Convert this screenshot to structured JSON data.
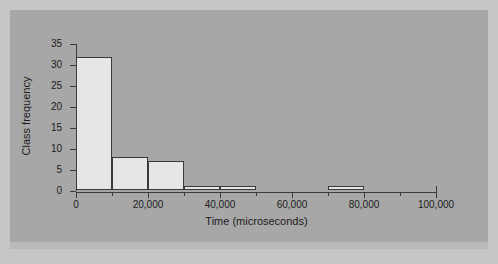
{
  "chart_data": {
    "type": "bar",
    "title": "",
    "subtitle": "",
    "xlabel": "Time (microseconds)",
    "ylabel": "Class frequency",
    "xlim": [
      0,
      100000
    ],
    "ylim": [
      0,
      35
    ],
    "grid": false,
    "legend": null,
    "bin_width": 10000,
    "x_ticks_major": [
      {
        "value": 0,
        "label": "0"
      },
      {
        "value": 20000,
        "label": "20,000"
      },
      {
        "value": 40000,
        "label": "40,000"
      },
      {
        "value": 60000,
        "label": "60,000"
      },
      {
        "value": 80000,
        "label": "80,000"
      },
      {
        "value": 100000,
        "label": "100,000"
      }
    ],
    "x_ticks_minor": [
      10000,
      30000,
      50000,
      70000,
      90000
    ],
    "y_ticks": [
      {
        "value": 0,
        "label": "0"
      },
      {
        "value": 5,
        "label": "5"
      },
      {
        "value": 10,
        "label": "10"
      },
      {
        "value": 15,
        "label": "15"
      },
      {
        "value": 20,
        "label": "20"
      },
      {
        "value": 25,
        "label": "25"
      },
      {
        "value": 30,
        "label": "30"
      },
      {
        "value": 35,
        "label": "35"
      }
    ],
    "bins": [
      {
        "start": 0,
        "end": 10000,
        "label": "0–10,000",
        "value": 32
      },
      {
        "start": 10000,
        "end": 20000,
        "label": "10,000–20,000",
        "value": 8
      },
      {
        "start": 20000,
        "end": 30000,
        "label": "20,000–30,000",
        "value": 7
      },
      {
        "start": 30000,
        "end": 40000,
        "label": "30,000–40,000",
        "value": 1
      },
      {
        "start": 40000,
        "end": 50000,
        "label": "40,000–50,000",
        "value": 1
      },
      {
        "start": 70000,
        "end": 80000,
        "label": "70,000–80,000",
        "value": 1
      }
    ],
    "categories": [
      "0–10,000",
      "10,000–20,000",
      "20,000–30,000",
      "30,000–40,000",
      "40,000–50,000",
      "70,000–80,000"
    ],
    "values": [
      32,
      8,
      7,
      1,
      1,
      1
    ]
  },
  "colors": {
    "figure_background": "#c6c6c6",
    "panel_background": "#a7a7a7",
    "bar_fill": "#e6e6e6",
    "bar_stroke": "#3a3a3a",
    "axis": "#3a3a3a",
    "text": "#1c1c1c"
  }
}
